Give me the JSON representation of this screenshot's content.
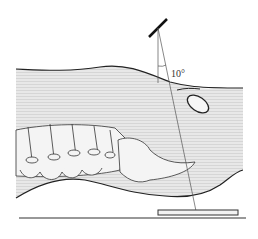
{
  "diagram": {
    "angle_label": "10°",
    "colors": {
      "body_fill": "#e6e6e6",
      "stripe": "#d4d4d4",
      "outline": "#222222",
      "beam": "#555555",
      "bone_fill": "#f4f4f4"
    }
  }
}
